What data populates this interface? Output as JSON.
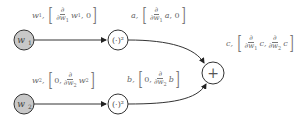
{
  "nodes": {
    "w1": {
      "label": "w",
      "sub": "1"
    },
    "w2": {
      "label": "w",
      "sub": "2"
    },
    "sq1": {
      "label": "(·)²"
    },
    "sq2": {
      "label": "(·)²"
    },
    "plus": {
      "label": "+"
    }
  },
  "edges": {
    "w1_sq1": {
      "var": "w",
      "sub": "1",
      "pre": "",
      "num": "∂",
      "den": "∂w",
      "den_sub": "1",
      "after": "w",
      "after_sub": "1",
      "post": ", 0"
    },
    "w2_sq2": {
      "var": "w",
      "sub": "2",
      "pre": "0, ",
      "num": "∂",
      "den": "∂w",
      "den_sub": "2",
      "after": "w",
      "after_sub": "2",
      "post": ""
    },
    "sq1_plus": {
      "var": "a",
      "pre": "",
      "num": "∂",
      "den": "∂w",
      "den_sub": "1",
      "after": "a",
      "post": ", 0"
    },
    "sq2_plus": {
      "var": "b",
      "pre": "0, ",
      "num": "∂",
      "den": "∂w",
      "den_sub": "2",
      "after": "b",
      "post": ""
    },
    "out": {
      "var": "c",
      "num": "∂",
      "den1": "∂w",
      "den1_sub": "1",
      "after1": "c,",
      "den2": "∂w",
      "den2_sub": "2",
      "after2": "c"
    }
  },
  "colors": {
    "input_fill": "#c8c8c8",
    "stroke": "#333333",
    "text": "#666666"
  }
}
